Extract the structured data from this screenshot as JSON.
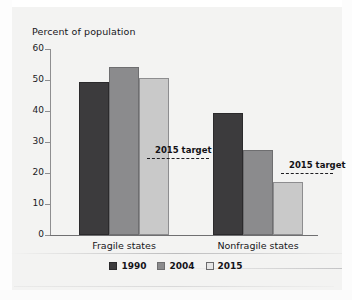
{
  "chart_data": {
    "type": "bar",
    "title": "",
    "ylabel": "Percent of population",
    "xlabel": "",
    "ylim": [
      0,
      60
    ],
    "yticks": [
      0,
      10,
      20,
      30,
      40,
      50,
      60
    ],
    "grid": false,
    "legend_position": "bottom-center",
    "categories": [
      "Fragile states",
      "Nonfragile states"
    ],
    "series": [
      {
        "name": "1990",
        "color": "#3c3b3d",
        "values": [
          49.3,
          39.5
        ]
      },
      {
        "name": "2004",
        "color": "#8b8b8d",
        "values": [
          54.2,
          27.4
        ]
      },
      {
        "name": "2015",
        "color": "#c9c9c9",
        "values": [
          50.6,
          17.1
        ]
      }
    ],
    "annotations": [
      {
        "label": "2015 target",
        "group": "Fragile states",
        "value": 25
      },
      {
        "label": "2015 target",
        "group": "Nonfragile states",
        "value": 20
      }
    ]
  },
  "axis": {
    "y_title": "Percent of population",
    "y_tick_labels": [
      "60",
      "50",
      "40",
      "30",
      "20",
      "10",
      "0"
    ],
    "x_tick_labels": [
      "Fragile states",
      "Nonfragile states"
    ]
  },
  "legend": {
    "items": [
      {
        "label": "1990"
      },
      {
        "label": "2004"
      },
      {
        "label": "2015"
      }
    ]
  },
  "annotations": {
    "target_fragile": "2015 target",
    "target_nonfragile": "2015 target"
  },
  "colors": {
    "series_1990": "#3c3b3d",
    "series_2004": "#8b8b8d",
    "series_2015": "#c9c9c9",
    "background": "#f3f3f2",
    "axis": "#8e8e90",
    "text": "#17161a"
  }
}
